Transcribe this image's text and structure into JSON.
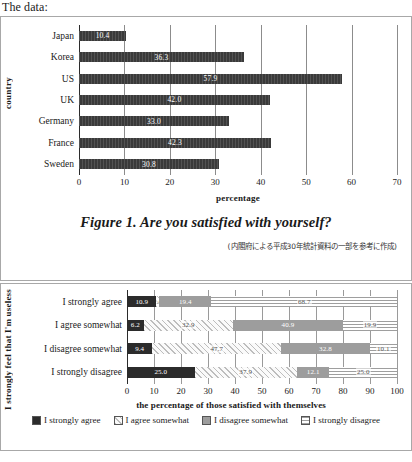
{
  "intro": {
    "text": "The data:"
  },
  "figure1": {
    "caption": "Figure 1. Are you satisfied with yourself?",
    "source_note": "(内閣府による平成30年統計資料の一部を参考に作成)",
    "ylabel": "country",
    "xlabel": "percentage"
  },
  "figure2": {
    "ylabel": "I strongly feel that I'm useless",
    "xlabel": "the percentage of those satisfied with themselves",
    "legend": [
      {
        "label": "I strongly agree",
        "swatch": "solid-dark-swatch"
      },
      {
        "label": "I agree somewhat",
        "swatch": "diagonal-hatch-swatch"
      },
      {
        "label": "I disagree somewhat",
        "swatch": "solid-gray-swatch"
      },
      {
        "label": "I strongly disagree",
        "swatch": "horizontal-line-swatch"
      }
    ]
  },
  "chart_data": [
    {
      "type": "bar",
      "orientation": "horizontal",
      "title": "Figure 1. Are you satisfied with yourself?",
      "xlabel": "percentage",
      "ylabel": "country",
      "categories": [
        "Japan",
        "Korea",
        "US",
        "UK",
        "Germany",
        "France",
        "Sweden"
      ],
      "values": [
        10.4,
        36.3,
        57.9,
        42.0,
        33.0,
        42.3,
        30.8
      ],
      "value_labels": [
        "10.4",
        "36.3",
        "57.9",
        "42.0",
        "33.0",
        "42.3",
        "30.8"
      ],
      "xlim": [
        0,
        70
      ],
      "xticks": [
        0,
        10,
        20,
        30,
        40,
        50,
        60,
        70
      ],
      "grid": true,
      "legend": false,
      "bar_color": "#3a3a3a"
    },
    {
      "type": "bar",
      "subtype": "stacked-100",
      "orientation": "horizontal",
      "xlabel": "the percentage of those satisfied with themselves",
      "ylabel": "I strongly feel that I'm useless",
      "categories": [
        "I strongly agree",
        "I agree somewhat",
        "I disagree somewhat",
        "I strongly disagree"
      ],
      "series": [
        {
          "name": "I strongly agree",
          "values": [
            10.9,
            6.2,
            9.4,
            25.0
          ]
        },
        {
          "name": "I agree somewhat",
          "values": [
            1.0,
            32.9,
            47.7,
            37.9
          ]
        },
        {
          "name": "I disagree somewhat",
          "values": [
            19.4,
            40.9,
            32.8,
            12.1
          ]
        },
        {
          "name": "I strongly disagree",
          "values": [
            68.7,
            19.9,
            10.1,
            25.0
          ]
        }
      ],
      "value_labels": [
        [
          "10.9",
          "1.0",
          "19.4",
          "68.7"
        ],
        [
          "6.2",
          "32.9",
          "40.9",
          "19.9"
        ],
        [
          "9.4",
          "47.7",
          "32.8",
          "10.1"
        ],
        [
          "25.0",
          "37.9",
          "12.1",
          "25.0"
        ]
      ],
      "xlim": [
        0,
        100
      ],
      "xticks": [
        0,
        10,
        20,
        30,
        40,
        50,
        60,
        70,
        80,
        90,
        100
      ],
      "grid": true,
      "legend": true,
      "legend_position": "bottom"
    }
  ]
}
